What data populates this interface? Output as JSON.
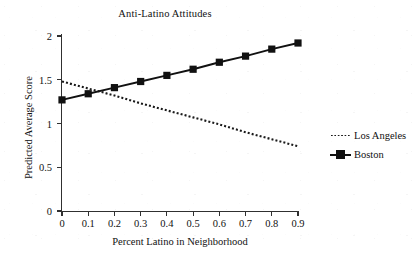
{
  "chart_data": {
    "type": "line",
    "title": "Anti-Latino Attitudes",
    "xlabel": "Percent Latino in Neighborhood",
    "ylabel": "Predicted Average Score",
    "x": [
      0,
      0.1,
      0.2,
      0.3,
      0.4,
      0.5,
      0.6,
      0.7,
      0.8,
      0.9
    ],
    "xtick_labels": [
      "0",
      "0.1",
      "0.2",
      "0.3",
      "0.4",
      "0.5",
      "0.6",
      "0.7",
      "0.8",
      "0.9"
    ],
    "ytick_labels": [
      "0",
      "0.5",
      "1",
      "1.5",
      "2"
    ],
    "ytick_values": [
      0,
      0.5,
      1,
      1.5,
      2
    ],
    "xlim": [
      0,
      0.9
    ],
    "ylim": [
      0,
      2
    ],
    "grid": false,
    "legend_position": "right",
    "series": [
      {
        "name": "Los Angeles",
        "style": "dotted",
        "marker": "none",
        "color": "#1a1a1a",
        "values": [
          1.48,
          1.4,
          1.32,
          1.23,
          1.15,
          1.07,
          0.99,
          0.9,
          0.82,
          0.74
        ]
      },
      {
        "name": "Boston",
        "style": "solid",
        "marker": "square",
        "color": "#111111",
        "values": [
          1.27,
          1.34,
          1.41,
          1.48,
          1.55,
          1.62,
          1.7,
          1.77,
          1.85,
          1.92
        ]
      }
    ]
  },
  "legend": {
    "items": [
      {
        "label": "Los Angeles",
        "style": "dotted",
        "marker": "none"
      },
      {
        "label": "Boston",
        "style": "solid",
        "marker": "square"
      }
    ]
  },
  "colors": {
    "axis": "#303030",
    "text": "#111111",
    "series_boston": "#111111",
    "series_los_angeles": "#1a1a1a",
    "background": "#ffffff"
  }
}
